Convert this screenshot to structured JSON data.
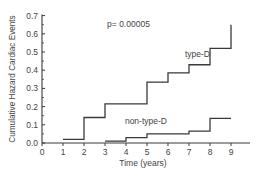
{
  "chart_data": {
    "type": "line",
    "subtype": "step",
    "title": "",
    "xlabel": "Time (years)",
    "ylabel": "Cumulative Hazard Cardiac Events",
    "xlim": [
      0,
      9.9
    ],
    "ylim": [
      0,
      0.7
    ],
    "x_ticks": [
      0,
      1,
      2,
      3,
      4,
      5,
      6,
      7,
      8,
      9
    ],
    "y_ticks": [
      0.0,
      0.1,
      0.2,
      0.3,
      0.4,
      0.5,
      0.6,
      0.7
    ],
    "y_tick_labels": [
      "0.0",
      "0.1",
      "0.2",
      "0.3",
      "0.4",
      "0.5",
      "0.6",
      "0.7"
    ],
    "grid": false,
    "legend": "inline labels",
    "annotations": [
      {
        "text": "p= 0.00005",
        "x": 3.1,
        "y": 0.64
      }
    ],
    "series": [
      {
        "name": "type-D",
        "label_pos": {
          "x": 7.4,
          "y": 0.47
        },
        "steps": [
          {
            "x": 1,
            "y": 0.02
          },
          {
            "x": 2,
            "y": 0.14
          },
          {
            "x": 3,
            "y": 0.215
          },
          {
            "x": 5,
            "y": 0.335
          },
          {
            "x": 6,
            "y": 0.385
          },
          {
            "x": 7,
            "y": 0.43
          },
          {
            "x": 8,
            "y": 0.52
          },
          {
            "x": 9,
            "y": 0.65
          }
        ],
        "end_x": 9
      },
      {
        "name": "non-type-D",
        "label_pos": {
          "x": 4.95,
          "y": 0.105
        },
        "steps": [
          {
            "x": 3,
            "y": 0.01
          },
          {
            "x": 4,
            "y": 0.03
          },
          {
            "x": 5,
            "y": 0.05
          },
          {
            "x": 7,
            "y": 0.065
          },
          {
            "x": 8,
            "y": 0.135
          }
        ],
        "end_x": 9
      }
    ]
  }
}
